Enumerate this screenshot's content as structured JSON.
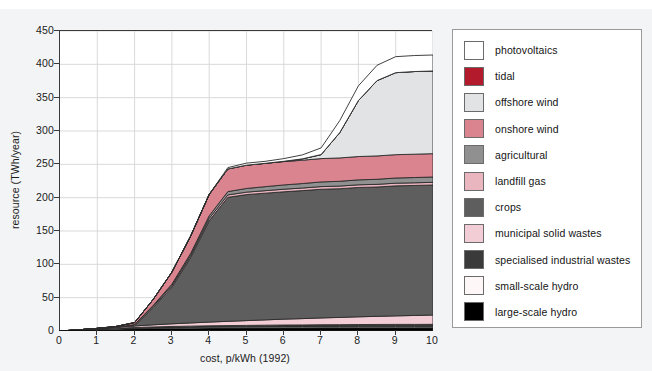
{
  "figure": {
    "background_color": "#f3f4f5",
    "plot_background_color": "#ffffff",
    "grid_color": "#d9d9d9"
  },
  "chart_data": {
    "type": "area",
    "title": "",
    "subtitle": "",
    "xlabel": "cost, p/kWh (1992)",
    "ylabel": "resource (TWh/year)",
    "xlim": [
      0,
      10
    ],
    "ylim": [
      0,
      450
    ],
    "xticks": [
      "0",
      "1",
      "2",
      "3",
      "4",
      "5",
      "6",
      "7",
      "8",
      "9",
      "10"
    ],
    "yticks": [
      "0",
      "50",
      "100",
      "150",
      "200",
      "250",
      "300",
      "350",
      "400",
      "450"
    ],
    "grid": true,
    "stacked": true,
    "legend_position": "right",
    "x": [
      0,
      0.5,
      1,
      1.5,
      2,
      2.5,
      3,
      3.5,
      4,
      4.5,
      5,
      5.5,
      6,
      6.5,
      7,
      7.5,
      8,
      8.5,
      9,
      9.5,
      10
    ],
    "series": [
      {
        "name": "large-scale hydro",
        "color": "#000000",
        "values": [
          0,
          1.0,
          2.0,
          2.8,
          3.4,
          3.8,
          4.1,
          4.3,
          4.5,
          4.6,
          4.7,
          4.8,
          4.9,
          4.9,
          5.0,
          5.0,
          5.0,
          5.0,
          5.0,
          5.0,
          5.0
        ]
      },
      {
        "name": "small-scale hydro",
        "color": "#fdf7f7",
        "values": [
          0,
          0.2,
          0.4,
          0.6,
          0.8,
          1.0,
          1.2,
          1.3,
          1.4,
          1.5,
          1.6,
          1.7,
          1.8,
          1.8,
          1.9,
          1.9,
          2.0,
          2.0,
          2.0,
          2.0,
          2.0
        ]
      },
      {
        "name": "specialised industrial wastes",
        "color": "#3a3a3a",
        "values": [
          0,
          0.2,
          0.5,
          0.8,
          1.0,
          1.3,
          1.5,
          1.7,
          1.9,
          2.0,
          2.1,
          2.2,
          2.3,
          2.4,
          2.5,
          2.6,
          2.7,
          2.8,
          2.9,
          2.9,
          3.0
        ]
      },
      {
        "name": "municipal solid wastes",
        "color": "#f2cdd5",
        "values": [
          0,
          0.4,
          1.0,
          1.6,
          2.4,
          3.2,
          4.0,
          4.8,
          5.6,
          6.4,
          7.2,
          8.0,
          8.8,
          9.5,
          10.2,
          10.9,
          11.6,
          12.2,
          12.8,
          13.4,
          14.0
        ]
      },
      {
        "name": "crops",
        "color": "#5e5e5e",
        "values": [
          0,
          0,
          0,
          0,
          0,
          26,
          55,
          98,
          152,
          186,
          189,
          190,
          191,
          192,
          193,
          193,
          194,
          194,
          195,
          195,
          195
        ]
      },
      {
        "name": "landfill gas",
        "color": "#e9b5bf",
        "values": [
          0,
          0,
          0,
          0,
          1.5,
          2.0,
          2.5,
          3.0,
          3.4,
          3.6,
          3.7,
          3.8,
          3.9,
          3.9,
          4.0,
          4.0,
          4.0,
          4.0,
          4.0,
          4.0,
          4.0
        ]
      },
      {
        "name": "agricultural",
        "color": "#909090",
        "values": [
          0,
          0,
          0,
          0,
          0.5,
          1.2,
          2.0,
          3.0,
          4.0,
          5.0,
          5.5,
          6.0,
          6.4,
          6.7,
          7.0,
          7.2,
          7.4,
          7.6,
          7.8,
          7.9,
          8.0
        ]
      },
      {
        "name": "onshore wind",
        "color": "#d9848f",
        "values": [
          0,
          0,
          0,
          1,
          3,
          9,
          18,
          26,
          32,
          34,
          35,
          35,
          35,
          35,
          35,
          35,
          35,
          35,
          35,
          35,
          35
        ]
      },
      {
        "name": "offshore wind",
        "color": "#e2e3e4",
        "values": [
          0,
          0,
          0,
          0,
          0,
          0,
          0,
          0,
          0,
          0,
          0,
          0,
          0.5,
          2,
          6,
          38,
          84,
          113,
          123,
          124,
          124
        ]
      },
      {
        "name": "tidal",
        "color": "#b31b2c",
        "values": [
          0,
          0,
          0,
          0,
          0,
          0,
          0,
          0,
          0,
          0,
          0,
          0,
          0,
          0,
          0,
          0,
          0,
          0,
          0,
          0,
          0
        ]
      },
      {
        "name": "photovoltaics",
        "color": "#ffffff",
        "values": [
          0,
          0,
          0,
          0,
          0,
          0,
          0,
          0,
          0,
          2,
          3,
          3,
          4,
          6,
          10,
          18,
          22,
          23,
          24,
          24,
          24
        ]
      }
    ]
  },
  "legend": {
    "items": [
      {
        "label": "photovoltaics",
        "color": "#ffffff"
      },
      {
        "label": "tidal",
        "color": "#b31b2c"
      },
      {
        "label": "offshore wind",
        "color": "#e2e3e4"
      },
      {
        "label": "onshore wind",
        "color": "#d9848f"
      },
      {
        "label": "agricultural",
        "color": "#909090"
      },
      {
        "label": "landfill gas",
        "color": "#e9b5bf"
      },
      {
        "label": "crops",
        "color": "#5e5e5e"
      },
      {
        "label": "municipal solid wastes",
        "color": "#f2cdd5"
      },
      {
        "label": "specialised industrial wastes",
        "color": "#3a3a3a"
      },
      {
        "label": "small-scale hydro",
        "color": "#fdf7f7"
      },
      {
        "label": "large-scale hydro",
        "color": "#000000"
      }
    ]
  }
}
